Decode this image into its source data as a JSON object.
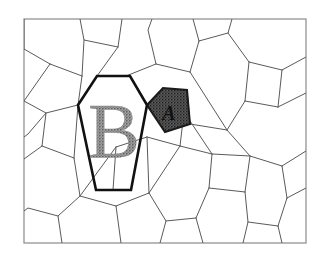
{
  "figure": {
    "type": "pentagonal-tiling-diagram",
    "background_color": "#ffffff",
    "frame": {
      "name": "diagram-border",
      "x": 24,
      "y": 19,
      "width": 282,
      "height": 224,
      "stroke_color": "#8a8a8a",
      "stroke_width": 1.2
    },
    "tile_stroke_color": "#5a5a5a",
    "tile_stroke_width": 1.0,
    "tile_fill_color": "#ffffff",
    "highlight": {
      "hexagon": {
        "name": "highlighted-hexagon-B",
        "label": "B",
        "stroke_color": "#111111",
        "stroke_width": 2.6,
        "fill_color": "none",
        "label_color": "#6f6f6f",
        "label_font_size": 78,
        "label_x": 114,
        "label_y": 157
      },
      "pentagon": {
        "name": "shaded-pentagon-A",
        "label": "A",
        "stroke_color": "#1a1a1a",
        "stroke_width": 2.0,
        "fill_color": "#5b5b5b",
        "label_color": "#111111",
        "label_font_size": 20,
        "label_x": 169,
        "label_y": 120
      }
    },
    "labels": [
      {
        "name": "label-A",
        "text": "A",
        "target": "shaded-pentagon-A"
      },
      {
        "name": "label-B",
        "text": "B",
        "target": "highlighted-hexagon-B"
      }
    ],
    "tile_paths": [
      "M24,19 L24,49 L50,64",
      "M50,64 L24,101",
      "M24,101 L46,113 L28,134 L24,137",
      "M46,113 L42,146",
      "M42,146 L24,159",
      "M42,146 L74,158",
      "M74,158 L80,196",
      "M80,196 L58,216 L62,243",
      "M58,216 L28,208 L24,211",
      "M80,196 L116,206",
      "M116,206 L121,243",
      "M116,206 L149,193",
      "M149,193 L166,221 L160,243",
      "M166,221 L196,218",
      "M196,218 L203,243",
      "M196,218 L209,188",
      "M209,188 L245,192",
      "M245,192 L248,222 L243,243",
      "M248,222 L278,226",
      "M278,226 L282,243",
      "M278,226 L287,198",
      "M287,198 L306,188",
      "M287,198 L282,166",
      "M282,166 L306,151",
      "M282,166 L250,156",
      "M250,156 L245,192",
      "M250,156 L227,130",
      "M227,130 L245,101",
      "M245,101 L278,107",
      "M278,107 L306,93",
      "M278,107 L282,70",
      "M282,70 L306,57",
      "M282,70 L249,62",
      "M249,62 L245,101",
      "M249,62 L228,33 L232,19",
      "M228,33 L199,41",
      "M199,41 L193,19",
      "M199,41 L190,72",
      "M190,72 L227,130",
      "M190,72 L156,64",
      "M156,64 L148,30 L152,19",
      "M156,64 L126,76",
      "M122,19 L118,47",
      "M118,47 L84,40 L80,19",
      "M118,47 L97,76",
      "M50,64 L82,76",
      "M82,76 L84,40",
      "M82,76 L78,105",
      "M78,105 L46,113",
      "M78,105 L97,76",
      "M209,188 L212,154",
      "M212,154 L180,146",
      "M180,146 L149,193",
      "M180,146 L184,112",
      "M184,112 L212,154",
      "M212,154 L250,156",
      "M180,146 L147,137",
      "M147,137 L149,193",
      "M147,137 L116,147",
      "M116,147 L80,196",
      "M116,147 L113,190",
      "M227,130 L190,124",
      "M190,124 L184,112",
      "M190,124 L187,90",
      "M78,105 L74,158",
      "M96,190 L131,190",
      "M96,190 L113,190"
    ],
    "hexagon_B_points": "97,76 130,76 147,105 131,190 96,190 78,105",
    "pentagon_A_points": "147,105 163,88 187,90 190,124 165,132"
  }
}
